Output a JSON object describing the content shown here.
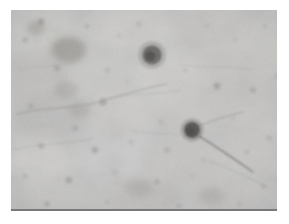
{
  "figure": {
    "kind": "photomicrograph",
    "caption": "",
    "canvas": {
      "width": 289,
      "height": 224
    },
    "plate": {
      "x": 11,
      "y": 10,
      "width": 266,
      "height": 201
    }
  },
  "colors": {
    "page_background": "#ffffff",
    "tissue_background": "#bdbdbd",
    "tissue_light": "#d2d0cc",
    "tissue_mid": "#b2b0ac",
    "tissue_dark": "#8e8c88",
    "stain_dark": "#4a4845",
    "stain_darkest": "#35332f",
    "fiber": "#7e7c78",
    "baseline_rule": "#787878"
  },
  "background_field": {
    "description": "mottled light grey neutral-stained tissue field",
    "patches": [
      {
        "cx": 38,
        "cy": 26,
        "rx": 34,
        "ry": 24,
        "tone": "#c9c7c3",
        "alpha": 0.55
      },
      {
        "cx": 120,
        "cy": 18,
        "rx": 44,
        "ry": 22,
        "tone": "#cfcdc9",
        "alpha": 0.5
      },
      {
        "cx": 205,
        "cy": 22,
        "rx": 40,
        "ry": 26,
        "tone": "#c4c2be",
        "alpha": 0.5
      },
      {
        "cx": 252,
        "cy": 40,
        "rx": 30,
        "ry": 30,
        "tone": "#cbc9c5",
        "alpha": 0.45
      },
      {
        "cx": 26,
        "cy": 70,
        "rx": 30,
        "ry": 28,
        "tone": "#b6b4b0",
        "alpha": 0.45
      },
      {
        "cx": 88,
        "cy": 62,
        "rx": 34,
        "ry": 26,
        "tone": "#c6c4c0",
        "alpha": 0.4
      },
      {
        "cx": 162,
        "cy": 66,
        "rx": 38,
        "ry": 28,
        "tone": "#cdcbc7",
        "alpha": 0.5
      },
      {
        "cx": 228,
        "cy": 78,
        "rx": 34,
        "ry": 28,
        "tone": "#bfbdb9",
        "alpha": 0.45
      },
      {
        "cx": 40,
        "cy": 112,
        "rx": 36,
        "ry": 26,
        "tone": "#b0aeaa",
        "alpha": 0.45
      },
      {
        "cx": 110,
        "cy": 104,
        "rx": 34,
        "ry": 24,
        "tone": "#c8c6c2",
        "alpha": 0.45
      },
      {
        "cx": 178,
        "cy": 104,
        "rx": 32,
        "ry": 26,
        "tone": "#c2c0bc",
        "alpha": 0.4
      },
      {
        "cx": 244,
        "cy": 118,
        "rx": 30,
        "ry": 28,
        "tone": "#cac8c4",
        "alpha": 0.45
      },
      {
        "cx": 30,
        "cy": 152,
        "rx": 34,
        "ry": 26,
        "tone": "#d4d2ce",
        "alpha": 0.55
      },
      {
        "cx": 100,
        "cy": 150,
        "rx": 36,
        "ry": 24,
        "tone": "#cecccb",
        "alpha": 0.5
      },
      {
        "cx": 172,
        "cy": 152,
        "rx": 34,
        "ry": 26,
        "tone": "#c3c1bd",
        "alpha": 0.45
      },
      {
        "cx": 238,
        "cy": 160,
        "rx": 32,
        "ry": 26,
        "tone": "#cbc9c5",
        "alpha": 0.45
      },
      {
        "cx": 46,
        "cy": 186,
        "rx": 38,
        "ry": 22,
        "tone": "#c6c4c0",
        "alpha": 0.45
      },
      {
        "cx": 130,
        "cy": 188,
        "rx": 40,
        "ry": 22,
        "tone": "#bab8b4",
        "alpha": 0.45
      },
      {
        "cx": 216,
        "cy": 190,
        "rx": 38,
        "ry": 22,
        "tone": "#c4c2be",
        "alpha": 0.45
      }
    ]
  },
  "stained_cells": [
    {
      "id": "cell-1",
      "label": "dark-stained cell body (upper centre)",
      "cx": 141,
      "cy": 45,
      "r": 9.5,
      "tone": "#4f4d4a",
      "alpha": 0.88
    },
    {
      "id": "cell-2",
      "label": "dark-stained cell body with process (centre right)",
      "cx": 181,
      "cy": 120,
      "r": 8.0,
      "tone": "#3d3b38",
      "alpha": 0.92
    }
  ],
  "cell_processes": [
    {
      "id": "process-1",
      "label": "thin neurite trailing lower-right from cell-2",
      "path": "M188,126 C204,136 222,148 242,162",
      "tone": "#6d6b67",
      "width": 1.5,
      "alpha": 0.75
    },
    {
      "id": "process-2",
      "label": "short neurite trailing upper-right from cell-2",
      "path": "M188,116 C202,110 216,106 232,102",
      "tone": "#7d7b77",
      "width": 1.1,
      "alpha": 0.55
    }
  ],
  "diffuse_blobs": [
    {
      "id": "blob-1",
      "label": "large diffuse stained mass (upper left)",
      "cx": 58,
      "cy": 40,
      "rx": 17,
      "ry": 13,
      "tone": "#8b8985",
      "alpha": 0.68
    },
    {
      "id": "blob-2",
      "label": "diffuse mass (upper left edge)",
      "cx": 25,
      "cy": 18,
      "rx": 9,
      "ry": 7,
      "tone": "#95938f",
      "alpha": 0.55
    },
    {
      "id": "blob-3",
      "label": "diffuse mass (mid left)",
      "cx": 55,
      "cy": 80,
      "rx": 12,
      "ry": 9,
      "tone": "#9a9894",
      "alpha": 0.5
    },
    {
      "id": "blob-4",
      "label": "diffuse mass (left of centre)",
      "cx": 68,
      "cy": 100,
      "rx": 11,
      "ry": 8,
      "tone": "#96948f",
      "alpha": 0.5
    },
    {
      "id": "blob-5",
      "label": "diffuse mass (lower centre)",
      "cx": 128,
      "cy": 178,
      "rx": 14,
      "ry": 9,
      "tone": "#9c9a96",
      "alpha": 0.45
    },
    {
      "id": "blob-6",
      "label": "diffuse mass (lower right)",
      "cx": 200,
      "cy": 186,
      "rx": 13,
      "ry": 9,
      "tone": "#a09e9a",
      "alpha": 0.4
    }
  ],
  "small_puncta": [
    {
      "cx": 30,
      "cy": 12,
      "r": 3.4,
      "tone": "#8d8b87",
      "alpha": 0.6
    },
    {
      "cx": 14,
      "cy": 30,
      "r": 3.0,
      "tone": "#969490",
      "alpha": 0.5
    },
    {
      "cx": 76,
      "cy": 16,
      "r": 2.6,
      "tone": "#9b9995",
      "alpha": 0.45
    },
    {
      "cx": 108,
      "cy": 26,
      "r": 2.4,
      "tone": "#a19f9b",
      "alpha": 0.4
    },
    {
      "cx": 128,
      "cy": 14,
      "r": 2.8,
      "tone": "#9a9894",
      "alpha": 0.45
    },
    {
      "cx": 196,
      "cy": 16,
      "r": 2.6,
      "tone": "#a3a19d",
      "alpha": 0.4
    },
    {
      "cx": 224,
      "cy": 30,
      "r": 2.2,
      "tone": "#a5a39f",
      "alpha": 0.4
    },
    {
      "cx": 254,
      "cy": 16,
      "r": 2.4,
      "tone": "#a09e9a",
      "alpha": 0.4
    },
    {
      "cx": 46,
      "cy": 58,
      "r": 3.2,
      "tone": "#8f8d89",
      "alpha": 0.55
    },
    {
      "cx": 96,
      "cy": 60,
      "r": 2.6,
      "tone": "#9c9a96",
      "alpha": 0.45
    },
    {
      "cx": 116,
      "cy": 72,
      "r": 2.2,
      "tone": "#a3a19d",
      "alpha": 0.4
    },
    {
      "cx": 174,
      "cy": 60,
      "r": 2.4,
      "tone": "#a09e9a",
      "alpha": 0.4
    },
    {
      "cx": 206,
      "cy": 76,
      "r": 3.6,
      "tone": "#8a8884",
      "alpha": 0.6
    },
    {
      "cx": 242,
      "cy": 80,
      "r": 3.0,
      "tone": "#929090",
      "alpha": 0.5
    },
    {
      "cx": 266,
      "cy": 66,
      "r": 2.6,
      "tone": "#9a9894",
      "alpha": 0.45
    },
    {
      "cx": 20,
      "cy": 96,
      "r": 2.8,
      "tone": "#949290",
      "alpha": 0.5
    },
    {
      "cx": 92,
      "cy": 92,
      "r": 3.8,
      "tone": "#878583",
      "alpha": 0.6
    },
    {
      "cx": 64,
      "cy": 118,
      "r": 3.0,
      "tone": "#909090",
      "alpha": 0.5
    },
    {
      "cx": 150,
      "cy": 112,
      "r": 2.6,
      "tone": "#9d9b97",
      "alpha": 0.45
    },
    {
      "cx": 222,
      "cy": 108,
      "r": 2.4,
      "tone": "#a19f9b",
      "alpha": 0.4
    },
    {
      "cx": 258,
      "cy": 128,
      "r": 2.8,
      "tone": "#989694",
      "alpha": 0.45
    },
    {
      "cx": 30,
      "cy": 136,
      "r": 3.0,
      "tone": "#8f8d8b",
      "alpha": 0.5
    },
    {
      "cx": 84,
      "cy": 140,
      "r": 3.4,
      "tone": "#8b8987",
      "alpha": 0.55
    },
    {
      "cx": 120,
      "cy": 132,
      "r": 2.6,
      "tone": "#9b9997",
      "alpha": 0.45
    },
    {
      "cx": 156,
      "cy": 140,
      "r": 3.0,
      "tone": "#969492",
      "alpha": 0.5
    },
    {
      "cx": 192,
      "cy": 150,
      "r": 2.4,
      "tone": "#a09e9c",
      "alpha": 0.4
    },
    {
      "cx": 236,
      "cy": 142,
      "r": 2.6,
      "tone": "#9c9a98",
      "alpha": 0.45
    },
    {
      "cx": 14,
      "cy": 166,
      "r": 2.6,
      "tone": "#9a9896",
      "alpha": 0.45
    },
    {
      "cx": 58,
      "cy": 170,
      "r": 3.2,
      "tone": "#8d8b89",
      "alpha": 0.55
    },
    {
      "cx": 104,
      "cy": 162,
      "r": 2.4,
      "tone": "#a29f9d",
      "alpha": 0.4
    },
    {
      "cx": 146,
      "cy": 172,
      "r": 2.8,
      "tone": "#949290",
      "alpha": 0.5
    },
    {
      "cx": 182,
      "cy": 166,
      "r": 2.4,
      "tone": "#9f9d9b",
      "alpha": 0.4
    },
    {
      "cx": 252,
      "cy": 176,
      "r": 2.6,
      "tone": "#989694",
      "alpha": 0.45
    },
    {
      "cx": 36,
      "cy": 194,
      "r": 2.8,
      "tone": "#929090",
      "alpha": 0.5
    },
    {
      "cx": 96,
      "cy": 192,
      "r": 2.4,
      "tone": "#9d9b99",
      "alpha": 0.4
    },
    {
      "cx": 168,
      "cy": 196,
      "r": 2.6,
      "tone": "#979593",
      "alpha": 0.45
    },
    {
      "cx": 228,
      "cy": 194,
      "r": 2.4,
      "tone": "#a09e9c",
      "alpha": 0.4
    }
  ],
  "fibers": [
    {
      "id": "fiber-1",
      "path": "M6,104 C34,96 62,100 88,92 C112,85 132,78 156,74",
      "tone": "#85837f",
      "width": 1.6,
      "alpha": 0.45
    },
    {
      "id": "fiber-2",
      "path": "M2,140 C30,132 56,136 82,128",
      "tone": "#8d8b87",
      "width": 1.2,
      "alpha": 0.35
    },
    {
      "id": "fiber-3",
      "path": "M98,88 C122,82 146,86 170,80",
      "tone": "#8a8884",
      "width": 1.1,
      "alpha": 0.32
    },
    {
      "id": "fiber-4",
      "path": "M168,54 C192,60 214,54 240,60",
      "tone": "#918f8b",
      "width": 1.0,
      "alpha": 0.3
    },
    {
      "id": "fiber-5",
      "path": "M120,120 C142,126 166,122 186,128",
      "tone": "#8e8c88",
      "width": 1.0,
      "alpha": 0.3
    },
    {
      "id": "fiber-6",
      "path": "M8,60 C28,54 46,58 64,52",
      "tone": "#949290",
      "width": 1.0,
      "alpha": 0.28
    },
    {
      "id": "fiber-7",
      "path": "M196,150 C216,158 236,166 258,178",
      "tone": "#8b8985",
      "width": 1.0,
      "alpha": 0.3
    }
  ]
}
